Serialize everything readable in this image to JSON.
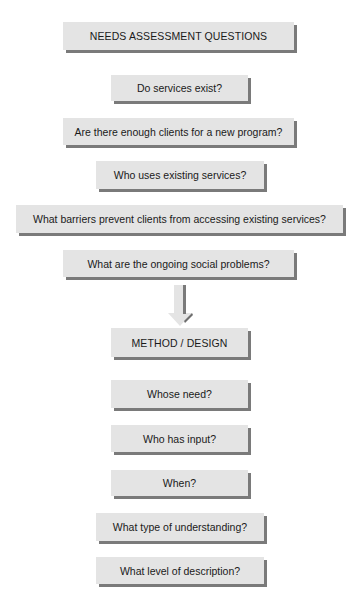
{
  "section1": {
    "title": "NEEDS ASSESSMENT QUESTIONS",
    "items": [
      "Do services exist?",
      "Are there enough clients for a new program?",
      "Who uses existing services?",
      "What barriers prevent clients from accessing existing services?",
      "What are the ongoing social problems?"
    ]
  },
  "connector": {
    "icon": "down-arrow-icon"
  },
  "section2": {
    "title": "METHOD / DESIGN",
    "items": [
      "Whose need?",
      "Who has input?",
      "When?",
      "What type of understanding?",
      "What level of description?"
    ]
  },
  "colors": {
    "box_fill": "#e4e4e4",
    "box_shadow": "#7a7a7a",
    "text": "#1a1a1a"
  }
}
